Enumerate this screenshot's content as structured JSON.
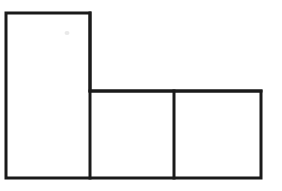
{
  "canvas": {
    "width": 282,
    "height": 191,
    "background_color": "#ffffff"
  },
  "figure": {
    "name": "L-shaped polyomino outline",
    "stroke_color": "#1a1a1a",
    "stroke_width": 3,
    "fill_color": "#ffffff",
    "cell_count": 3,
    "outline_points": "6,13 90,13 90,91 261,91 261,178 6,178",
    "divider_lines": [
      {
        "name": "step-and-top-edge-of-lower-row",
        "x1": 90,
        "y1": 91,
        "x2": 261,
        "y2": 91
      },
      {
        "name": "vertical-divider-between-lower-squares",
        "x1": 174,
        "y1": 91,
        "x2": 174,
        "y2": 178
      },
      {
        "name": "vertical-divider-right-of-tall-rectangle",
        "x1": 90,
        "y1": 13,
        "x2": 90,
        "y2": 178
      }
    ],
    "cells": [
      {
        "name": "tall-left-rectangle",
        "x": 6,
        "y": 13,
        "width": 84,
        "height": 165
      },
      {
        "name": "bottom-middle-square",
        "x": 90,
        "y": 91,
        "width": 84,
        "height": 87
      },
      {
        "name": "bottom-right-square",
        "x": 174,
        "y": 91,
        "width": 87,
        "height": 87
      }
    ],
    "artifacts": [
      {
        "name": "faint-gray-smudge",
        "cx": 67,
        "cy": 33,
        "rx": 2.5,
        "ry": 2,
        "color": "#e9e9e9"
      }
    ]
  }
}
